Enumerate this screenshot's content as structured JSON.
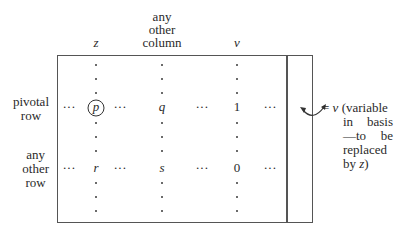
{
  "column_headers": {
    "z": "z",
    "other": [
      "any",
      "other",
      "column"
    ],
    "v": "v"
  },
  "row_labels": {
    "pivotal": [
      "pivotal",
      "row"
    ],
    "other": [
      "any",
      "other",
      "row"
    ]
  },
  "pivotal_row": {
    "ellipsis": "···",
    "pivot": "p",
    "other_col": "q",
    "v_col": "1"
  },
  "other_row": {
    "ellipsis": "···",
    "z_col": "r",
    "other_col": "s",
    "v_col": "0"
  },
  "annotation": {
    "equals": "=",
    "var": "v",
    "line1": "(variable",
    "line2": [
      "in",
      "basis"
    ],
    "line3": [
      "—to",
      "be"
    ],
    "line4": "replaced",
    "line5_prefix": "by ",
    "line5_var": "z",
    "line5_suffix": ")"
  }
}
